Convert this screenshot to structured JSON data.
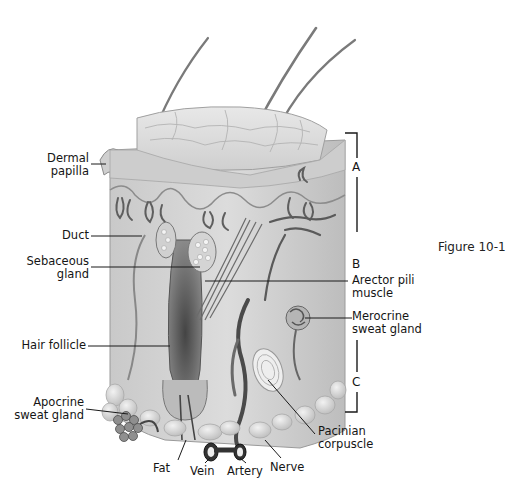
{
  "figure": {
    "caption": "Figure 10-1"
  },
  "layers": [
    {
      "letter": "A"
    },
    {
      "letter": "B"
    },
    {
      "letter": "C"
    }
  ],
  "labels_left": [
    {
      "line1": "Dermal",
      "line2": "papilla"
    },
    {
      "line1": "Duct",
      "line2": ""
    },
    {
      "line1": "Sebaceous",
      "line2": "gland"
    },
    {
      "line1": "Hair follicle",
      "line2": ""
    },
    {
      "line1": "Apocrine",
      "line2": "sweat gland"
    }
  ],
  "labels_right": [
    {
      "line1": "Arector pili",
      "line2": "muscle"
    },
    {
      "line1": "Merocrine",
      "line2": "sweat gland"
    },
    {
      "line1": "Pacinian",
      "line2": "corpuscle"
    }
  ],
  "labels_bottom": [
    {
      "text": "Fat"
    },
    {
      "text": "Vein"
    },
    {
      "text": "Artery"
    },
    {
      "text": "Nerve"
    }
  ],
  "colors": {
    "background": "#ffffff",
    "skin_light": "#d9d9d9",
    "skin_mid": "#b8b8b8",
    "skin_dark": "#6e6e6e",
    "line": "#1a1a1a"
  }
}
